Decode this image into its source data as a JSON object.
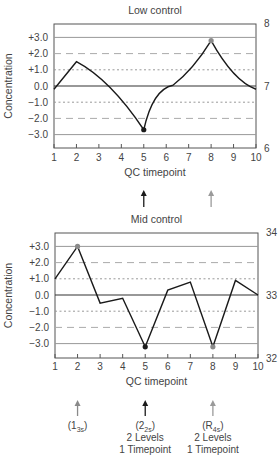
{
  "chart_data": [
    {
      "type": "line",
      "title": "Low control",
      "xlabel": "QC timepoint",
      "ylabel": "Concentration",
      "x": [
        1,
        2,
        3,
        4,
        5,
        6,
        7,
        8,
        9,
        10
      ],
      "values": [
        -0.2,
        1.5,
        0.3,
        -1.0,
        -2.7,
        0.0,
        1.2,
        2.8,
        1.0,
        -0.2
      ],
      "y_ticks": [
        "+3.0",
        "+2.0",
        "+1.0",
        "0.0",
        "−1.0",
        "−2.0",
        "−3.0"
      ],
      "right_axis_ticks": [
        "8",
        "7",
        "6"
      ],
      "ylim": [
        -3.7,
        3.8
      ],
      "highlight_points": [
        {
          "x": 5,
          "value": -2.7,
          "color": "#1a1a1a"
        },
        {
          "x": 8,
          "value": 2.8,
          "color": "#8a8a8a"
        }
      ],
      "reference_lines": {
        "solid": [
          3,
          0,
          -3
        ],
        "long_dash": [
          2,
          -2
        ],
        "short_dash": [
          1,
          -1
        ]
      }
    },
    {
      "type": "line",
      "title": "Mid control",
      "xlabel": "QC timepoint",
      "ylabel": "Concentration",
      "x": [
        1,
        2,
        3,
        4,
        5,
        6,
        7,
        8,
        9,
        10
      ],
      "values": [
        1.0,
        3.0,
        -0.5,
        -0.2,
        -3.2,
        0.3,
        0.8,
        -3.2,
        0.9,
        0.0
      ],
      "y_ticks": [
        "+3.0",
        "+2.0",
        "+1.0",
        "0.0",
        "−1.0",
        "−2.0",
        "−3.0"
      ],
      "right_axis_ticks": [
        "34",
        "33",
        "32"
      ],
      "ylim": [
        -3.8,
        3.8
      ],
      "highlight_points": [
        {
          "x": 2,
          "value": 3.0,
          "color": "#8a8a8a"
        },
        {
          "x": 5,
          "value": -3.2,
          "color": "#1a1a1a"
        },
        {
          "x": 8,
          "value": -3.2,
          "color": "#8a8a8a"
        }
      ],
      "reference_lines": {
        "solid": [
          3,
          0,
          -3
        ],
        "long_dash": [
          2,
          -2
        ],
        "short_dash": [
          1,
          -1
        ]
      }
    }
  ],
  "annotations": {
    "between_charts": [
      {
        "x": 5,
        "color": "#1a1a1a"
      },
      {
        "x": 8,
        "color": "#9a9a9a"
      }
    ],
    "bottom": [
      {
        "x": 2,
        "color": "#8a8a8a",
        "rule": "1",
        "rule_sub": "3s",
        "lines": []
      },
      {
        "x": 5,
        "color": "#1a1a1a",
        "rule": "2",
        "rule_sub": "2s",
        "lines": [
          "2 Levels",
          "1 Timepoint"
        ]
      },
      {
        "x": 8,
        "color": "#9a9a9a",
        "rule": "R",
        "rule_sub": "4s",
        "lines": [
          "2 Levels",
          "1 Timepoint"
        ]
      }
    ]
  },
  "labels": {
    "low_title": "Low control",
    "mid_title": "Mid control",
    "xlabel": "QC timepoint",
    "ylabel": "Concentration",
    "level_line": "2 Levels",
    "time_line": "1 Timepoint",
    "rule1_main": "(1",
    "rule1_sub": "3s",
    "rule2_main": "(2",
    "rule2_sub": "2s",
    "rule3_main": "(R",
    "rule3_sub": "4s",
    "close_paren": ")"
  }
}
